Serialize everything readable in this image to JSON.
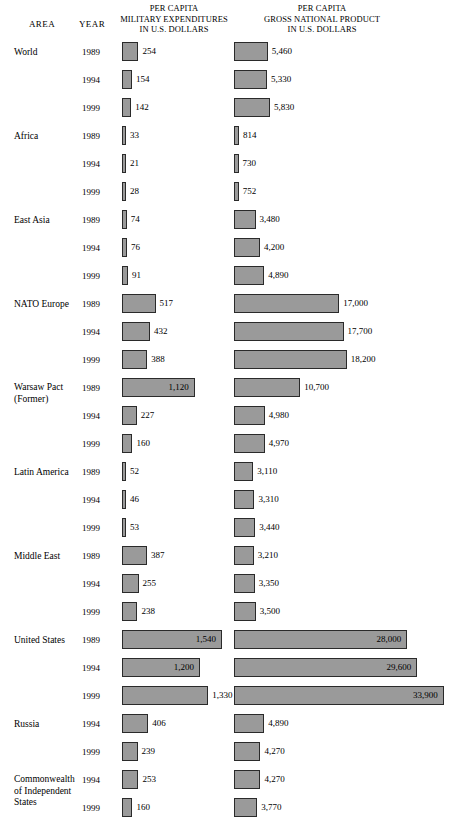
{
  "header": {
    "area": "AREA",
    "year": "YEAR",
    "military_title_lines": [
      "PER CAPITA",
      "MILITARY EXPENDITURES",
      "IN U.S. DOLLARS"
    ],
    "gnp_title_lines": [
      "PER CAPITA",
      "GROSS NATIONAL PRODUCT",
      "IN U.S. DOLLARS"
    ]
  },
  "style": {
    "bar_fill": "#9a9a9a",
    "bar_border": "#2a2a2a",
    "background": "#ffffff",
    "text": "#000000"
  },
  "chart_data": {
    "type": "bar",
    "orientation": "horizontal",
    "grid": false,
    "legend": false,
    "xlabel": "",
    "ylabel": "",
    "series": [
      {
        "name": "PER CAPITA MILITARY EXPENDITURES IN U.S. DOLLARS",
        "max_value": 1540,
        "values": [
          254,
          154,
          142,
          33,
          21,
          28,
          74,
          76,
          91,
          517,
          432,
          388,
          1120,
          227,
          160,
          52,
          46,
          53,
          387,
          255,
          238,
          1540,
          1200,
          1330,
          406,
          239,
          253,
          160
        ]
      },
      {
        "name": "PER CAPITA GROSS NATIONAL PRODUCT IN U.S. DOLLARS",
        "max_value": 33900,
        "values": [
          5460,
          5330,
          5830,
          814,
          730,
          752,
          3480,
          4200,
          4890,
          17000,
          17700,
          18200,
          10700,
          4980,
          4970,
          3110,
          3310,
          3440,
          3210,
          3350,
          3500,
          28000,
          29600,
          33900,
          4890,
          4270,
          4270,
          3770
        ]
      }
    ],
    "rows": [
      {
        "area": "World",
        "area_lines": [
          "World"
        ],
        "year": "1989",
        "military": 254,
        "military_label": "254",
        "gnp": 5460,
        "gnp_label": "5,460"
      },
      {
        "area": "",
        "area_lines": [],
        "year": "1994",
        "military": 154,
        "military_label": "154",
        "gnp": 5330,
        "gnp_label": "5,330"
      },
      {
        "area": "",
        "area_lines": [],
        "year": "1999",
        "military": 142,
        "military_label": "142",
        "gnp": 5830,
        "gnp_label": "5,830"
      },
      {
        "area": "Africa",
        "area_lines": [
          "Africa"
        ],
        "year": "1989",
        "military": 33,
        "military_label": "33",
        "gnp": 814,
        "gnp_label": "814"
      },
      {
        "area": "",
        "area_lines": [],
        "year": "1994",
        "military": 21,
        "military_label": "21",
        "gnp": 730,
        "gnp_label": "730"
      },
      {
        "area": "",
        "area_lines": [],
        "year": "1999",
        "military": 28,
        "military_label": "28",
        "gnp": 752,
        "gnp_label": "752"
      },
      {
        "area": "East Asia",
        "area_lines": [
          "East Asia"
        ],
        "year": "1989",
        "military": 74,
        "military_label": "74",
        "gnp": 3480,
        "gnp_label": "3,480"
      },
      {
        "area": "",
        "area_lines": [],
        "year": "1994",
        "military": 76,
        "military_label": "76",
        "gnp": 4200,
        "gnp_label": "4,200"
      },
      {
        "area": "",
        "area_lines": [],
        "year": "1999",
        "military": 91,
        "military_label": "91",
        "gnp": 4890,
        "gnp_label": "4,890"
      },
      {
        "area": "NATO Europe",
        "area_lines": [
          "NATO Europe"
        ],
        "year": "1989",
        "military": 517,
        "military_label": "517",
        "gnp": 17000,
        "gnp_label": "17,000"
      },
      {
        "area": "",
        "area_lines": [],
        "year": "1994",
        "military": 432,
        "military_label": "432",
        "gnp": 17700,
        "gnp_label": "17,700"
      },
      {
        "area": "",
        "area_lines": [],
        "year": "1999",
        "military": 388,
        "military_label": "388",
        "gnp": 18200,
        "gnp_label": "18,200"
      },
      {
        "area": "Warsaw Pact (Former)",
        "area_lines": [
          "Warsaw Pact",
          "(Former)"
        ],
        "year": "1989",
        "military": 1120,
        "military_label": "1,120",
        "military_inside": true,
        "gnp": 10700,
        "gnp_label": "10,700"
      },
      {
        "area": "",
        "area_lines": [],
        "year": "1994",
        "military": 227,
        "military_label": "227",
        "gnp": 4980,
        "gnp_label": "4,980"
      },
      {
        "area": "",
        "area_lines": [],
        "year": "1999",
        "military": 160,
        "military_label": "160",
        "gnp": 4970,
        "gnp_label": "4,970"
      },
      {
        "area": "Latin America",
        "area_lines": [
          "Latin America"
        ],
        "year": "1989",
        "military": 52,
        "military_label": "52",
        "gnp": 3110,
        "gnp_label": "3,110"
      },
      {
        "area": "",
        "area_lines": [],
        "year": "1994",
        "military": 46,
        "military_label": "46",
        "gnp": 3310,
        "gnp_label": "3,310"
      },
      {
        "area": "",
        "area_lines": [],
        "year": "1999",
        "military": 53,
        "military_label": "53",
        "gnp": 3440,
        "gnp_label": "3,440"
      },
      {
        "area": "Middle East",
        "area_lines": [
          "Middle East"
        ],
        "year": "1989",
        "military": 387,
        "military_label": "387",
        "gnp": 3210,
        "gnp_label": "3,210"
      },
      {
        "area": "",
        "area_lines": [],
        "year": "1994",
        "military": 255,
        "military_label": "255",
        "gnp": 3350,
        "gnp_label": "3,350"
      },
      {
        "area": "",
        "area_lines": [],
        "year": "1999",
        "military": 238,
        "military_label": "238",
        "gnp": 3500,
        "gnp_label": "3,500"
      },
      {
        "area": "United States",
        "area_lines": [
          "United States"
        ],
        "year": "1989",
        "military": 1540,
        "military_label": "1,540",
        "military_inside": true,
        "gnp": 28000,
        "gnp_label": "28,000",
        "gnp_inside": true
      },
      {
        "area": "",
        "area_lines": [],
        "year": "1994",
        "military": 1200,
        "military_label": "1,200",
        "military_inside": true,
        "gnp": 29600,
        "gnp_label": "29,600",
        "gnp_inside": true
      },
      {
        "area": "",
        "area_lines": [],
        "year": "1999",
        "military": 1330,
        "military_label": "1,330",
        "gnp": 33900,
        "gnp_label": "33,900",
        "gnp_inside": true
      },
      {
        "area": "Russia",
        "area_lines": [
          "Russia"
        ],
        "year": "1994",
        "military": 406,
        "military_label": "406",
        "gnp": 4890,
        "gnp_label": "4,890"
      },
      {
        "area": "",
        "area_lines": [],
        "year": "1999",
        "military": 239,
        "military_label": "239",
        "gnp": 4270,
        "gnp_label": "4,270"
      },
      {
        "area": "Commonwealth of Independent States",
        "area_lines": [
          "Commonwealth",
          "of Independent",
          "States"
        ],
        "year": "1994",
        "military": 253,
        "military_label": "253",
        "gnp": 4270,
        "gnp_label": "4,270"
      },
      {
        "area": "",
        "area_lines": [],
        "year": "1999",
        "military": 160,
        "military_label": "160",
        "gnp": 3770,
        "gnp_label": "3,770"
      }
    ]
  },
  "scale": {
    "military_px_per_unit": 0.0649,
    "military_min_px": 4,
    "gnp_px_per_unit": 0.00619,
    "gnp_min_px": 4
  },
  "layout": {
    "first_row_top": 42,
    "row_height": 28
  }
}
